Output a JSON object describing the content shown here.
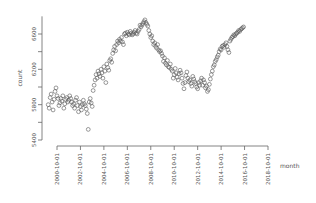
{
  "chart_data": {
    "type": "scatter",
    "title": "",
    "xlabel": "month",
    "ylabel": "count",
    "ylim": [
      5400,
      6800
    ],
    "xlim": [
      "2000-01-01",
      "2018-10-01"
    ],
    "grid": false,
    "legend": null,
    "marker": "open-circle",
    "marker_color": "#555555",
    "x_ticks": [
      "2000-10-01",
      "2002-10-01",
      "2004-10-01",
      "2006-10-01",
      "2008-10-01",
      "2010-10-01",
      "2012-10-01",
      "2014-10-01",
      "2016-10-01",
      "2018-10-01"
    ],
    "y_ticks": [
      5400,
      5800,
      6200,
      6600
    ],
    "y_minor_ticks": [
      5600,
      6000,
      6400
    ],
    "series": [
      {
        "name": "count",
        "start": "2000-01-01",
        "frequency": "monthly",
        "values": [
          5800,
          5760,
          5880,
          5920,
          5830,
          5740,
          5860,
          5950,
          5990,
          5900,
          5870,
          5790,
          5820,
          5870,
          5840,
          5900,
          5760,
          5810,
          5860,
          5880,
          5830,
          5850,
          5900,
          5870,
          5830,
          5790,
          5810,
          5760,
          5850,
          5880,
          5790,
          5720,
          5830,
          5780,
          5740,
          5800,
          5850,
          5810,
          5790,
          5750,
          5700,
          5520,
          5830,
          5870,
          5820,
          5780,
          5960,
          6020,
          6080,
          6140,
          6100,
          6180,
          6150,
          6120,
          6200,
          6160,
          6100,
          6230,
          6180,
          6050,
          6260,
          6220,
          6190,
          6300,
          6320,
          6280,
          6380,
          6420,
          6460,
          6410,
          6480,
          6520,
          6500,
          6540,
          6520,
          6560,
          6510,
          6480,
          6600,
          6610,
          6580,
          6620,
          6600,
          6590,
          6630,
          6610,
          6590,
          6600,
          6620,
          6640,
          6610,
          6600,
          6630,
          6650,
          6700,
          6680,
          6700,
          6720,
          6740,
          6760,
          6730,
          6710,
          6690,
          6640,
          6600,
          6560,
          6580,
          6520,
          6480,
          6500,
          6460,
          6440,
          6480,
          6420,
          6400,
          6410,
          6380,
          6350,
          6290,
          6330,
          6270,
          6250,
          6300,
          6230,
          6220,
          6260,
          6200,
          6180,
          6100,
          6140,
          6210,
          6160,
          6110,
          6080,
          6150,
          6190,
          6160,
          6100,
          6040,
          5980,
          6050,
          6130,
          6170,
          6100,
          6060,
          6080,
          6040,
          6010,
          6120,
          6090,
          6060,
          6040,
          6000,
          5980,
          6050,
          6020,
          6070,
          6100,
          6020,
          6080,
          6050,
          5990,
          6010,
          5950,
          5970,
          6030,
          6090,
          6140,
          6180,
          6230,
          6250,
          6290,
          6310,
          6340,
          6360,
          6400,
          6430,
          6420,
          6460,
          6470,
          6450,
          6480,
          6500,
          6460,
          6420,
          6390,
          6520,
          6540,
          6560,
          6570,
          6590,
          6580,
          6600,
          6610,
          6620,
          6640,
          6630,
          6650,
          6660,
          6670,
          6680
        ]
      }
    ]
  },
  "axes": {
    "ylabel": "count",
    "xlabel": "month",
    "y_tick_labels": [
      "5400",
      "5800",
      "6200",
      "6600"
    ],
    "x_tick_labels": [
      "2000-10-01",
      "2002-10-01",
      "2004-10-01",
      "2006-10-01",
      "2008-10-01",
      "2010-10-01",
      "2012-10-01",
      "2014-10-01",
      "2016-10-01",
      "2018-10-01"
    ]
  }
}
